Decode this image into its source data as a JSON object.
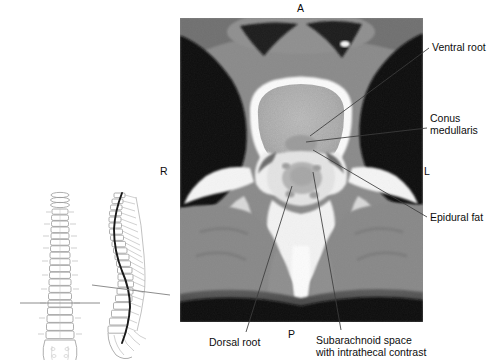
{
  "figure": {
    "kind": "axial-ct-with-spine-locator-diagrams",
    "region": "lumbar spine axial CT myelogram"
  },
  "ct": {
    "x": 180,
    "y": 18,
    "width": 243,
    "height": 304,
    "background_color": "#000000",
    "soft_tissue_color": "#8c8c8c",
    "bone_color": "#f2f2f2",
    "air_color": "#0a0a0a",
    "contrast_color": "#d9d9d9"
  },
  "orientation_markers": [
    {
      "label": "A",
      "name": "anterior",
      "x": 300,
      "y": 3
    },
    {
      "label": "R",
      "name": "right",
      "x": 162,
      "y": 166,
      "on_image": false
    },
    {
      "label": "L",
      "name": "left",
      "x": 424,
      "y": 166,
      "on_image": false
    },
    {
      "label": "P",
      "name": "posterior",
      "x": 290,
      "y": 330
    }
  ],
  "annotations": [
    {
      "id": "ventral-root",
      "label": "Ventral root",
      "text_x": 432,
      "text_y": 41,
      "leader": [
        [
          429,
          48
        ],
        [
          310,
          136
        ]
      ]
    },
    {
      "id": "conus-medullaris",
      "label": "Conus\nmedullaris",
      "label_line1": "Conus",
      "label_line2": "medullaris",
      "text_x": 430,
      "text_y": 114,
      "leader": [
        [
          427,
          128
        ],
        [
          306,
          142
        ]
      ]
    },
    {
      "id": "epidural-fat",
      "label": "Epidural fat",
      "text_x": 430,
      "text_y": 213,
      "leader": [
        [
          427,
          218
        ],
        [
          312,
          150
        ]
      ]
    },
    {
      "id": "dorsal-root",
      "label": "Dorsal root",
      "text_x": 209,
      "text_y": 338,
      "leader": [
        [
          245,
          334
        ],
        [
          292,
          186
        ]
      ]
    },
    {
      "id": "subarachnoid-space",
      "label": "Subarachnoid space\nwith intrathecal contrast",
      "label_line1": "Subarachnoid space",
      "label_line2": "with intrathecal contrast",
      "text_x": 316,
      "text_y": 336,
      "leader": [
        [
          340,
          332
        ],
        [
          313,
          172
        ]
      ]
    }
  ],
  "diagrams": [
    {
      "id": "spine-ap",
      "name": "spine-frontal-view",
      "x": 18,
      "y": 185,
      "width": 84,
      "height": 175,
      "slice_line": {
        "x1": 5,
        "y1": 118,
        "x2": 80,
        "y2": 118
      }
    },
    {
      "id": "spine-lateral",
      "name": "spine-lateral-view",
      "x": 92,
      "y": 185,
      "width": 86,
      "height": 175,
      "slice_line": {
        "x1": 3,
        "y1": 104,
        "x2": 78,
        "y2": 112
      }
    }
  ],
  "colors": {
    "leader_line": "#3c3c3c",
    "diagram_stroke": "#9a9a9a",
    "cord_stroke": "#1a1a1a",
    "slice_line": "#808080",
    "text": "#0d0d0d"
  }
}
